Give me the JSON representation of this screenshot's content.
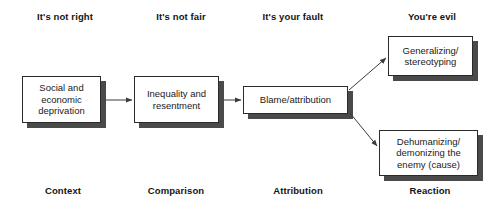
{
  "diagram": {
    "phase_labels": [
      {
        "id": "phase-its-not-right",
        "text": "It's not right",
        "x": 28,
        "y": 11,
        "width": 74
      },
      {
        "id": "phase-its-not-fair",
        "text": "It's not fair",
        "x": 146,
        "y": 11,
        "width": 70
      },
      {
        "id": "phase-its-your-fault",
        "text": "It's your fault",
        "x": 253,
        "y": 11,
        "width": 80
      },
      {
        "id": "phase-youre-evil",
        "text": "You're evil",
        "x": 399,
        "y": 11,
        "width": 66
      }
    ],
    "nodes": [
      {
        "id": "node-social-economic-deprivation",
        "text": "Social and\neconomic\ndeprivation",
        "x": 22,
        "y": 76,
        "width": 79,
        "height": 47
      },
      {
        "id": "node-inequality-resentment",
        "text": "Inequality and\nresentment",
        "x": 134,
        "y": 76,
        "width": 85,
        "height": 47
      },
      {
        "id": "node-blame-attribution",
        "text": "Blame/attribution",
        "x": 243,
        "y": 86,
        "width": 105,
        "height": 28
      },
      {
        "id": "node-generalizing-stereotyping",
        "text": "Generalizing/\nstereotyping",
        "x": 388,
        "y": 36,
        "width": 85,
        "height": 40
      },
      {
        "id": "node-dehumanizing-demonizing",
        "text": "Dehumanizing/\ndemonizing the\nenemy (cause)",
        "x": 379,
        "y": 130,
        "width": 99,
        "height": 46
      }
    ],
    "arrows": [
      {
        "id": "arrow-deprivation-to-inequality",
        "from": "node-social-economic-deprivation",
        "to": "node-inequality-resentment",
        "x1": 106,
        "y1": 100,
        "x2": 132,
        "y2": 100
      },
      {
        "id": "arrow-inequality-to-blame",
        "from": "node-inequality-resentment",
        "to": "node-blame-attribution",
        "x1": 224,
        "y1": 100,
        "x2": 241,
        "y2": 100
      },
      {
        "id": "arrow-blame-to-generalizing",
        "from": "node-blame-attribution",
        "to": "node-generalizing-stereotyping",
        "x1": 349,
        "y1": 90,
        "x2": 386,
        "y2": 58
      },
      {
        "id": "arrow-blame-to-dehumanizing",
        "from": "node-blame-attribution",
        "to": "node-dehumanizing-demonizing",
        "x1": 350,
        "y1": 113,
        "x2": 377,
        "y2": 146
      }
    ],
    "stage_labels": [
      {
        "id": "stage-context",
        "text": "Context",
        "x": 38,
        "y": 185,
        "width": 50
      },
      {
        "id": "stage-comparison",
        "text": "Comparison",
        "x": 142,
        "y": 185,
        "width": 68
      },
      {
        "id": "stage-attribution",
        "text": "Attribution",
        "x": 267,
        "y": 185,
        "width": 62
      },
      {
        "id": "stage-reaction",
        "text": "Reaction",
        "x": 404,
        "y": 185,
        "width": 52
      }
    ],
    "colors": {
      "background": "#ffffff",
      "node_border": "#2b2b2b",
      "node_fill": "#ffffff",
      "shadow": "#4a4a4a",
      "text": "#1a1a1a",
      "arrow": "#3a3a3a"
    }
  }
}
